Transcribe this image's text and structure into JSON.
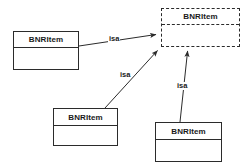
{
  "diagram": {
    "type": "uml-class-inheritance",
    "background_color": "#ffffff",
    "line_color": "#2b2b2b",
    "text_color": "#1a1a1a",
    "classes": [
      {
        "id": "superclass",
        "name": "BNRItem",
        "border_style": "dashed",
        "x": 161,
        "y": 8,
        "width": 79,
        "height": 39,
        "header_height": 16
      },
      {
        "id": "subclass-left",
        "name": "BNRItem",
        "border_style": "solid",
        "x": 13,
        "y": 31,
        "width": 66,
        "height": 39,
        "header_height": 16
      },
      {
        "id": "subclass-center",
        "name": "BNRItem",
        "border_style": "solid",
        "x": 53,
        "y": 108,
        "width": 65,
        "height": 38,
        "header_height": 17
      },
      {
        "id": "subclass-right",
        "name": "BNRItem",
        "border_style": "solid",
        "x": 155,
        "y": 122,
        "width": 67,
        "height": 40,
        "header_height": 17
      }
    ],
    "edges": [
      {
        "id": "isa-left",
        "label": "isa",
        "from": "subclass-left",
        "to": "superclass",
        "x1": 79,
        "y1": 46,
        "x2": 159,
        "y2": 34,
        "label_x": 108,
        "label_y": 35
      },
      {
        "id": "isa-center",
        "label": "isa",
        "from": "subclass-center",
        "to": "superclass",
        "x1": 105,
        "y1": 108,
        "x2": 160,
        "y2": 48,
        "label_x": 119,
        "label_y": 71
      },
      {
        "id": "isa-right",
        "label": "isa",
        "from": "subclass-right",
        "to": "superclass",
        "x1": 180,
        "y1": 122,
        "x2": 188,
        "y2": 48,
        "label_x": 176,
        "label_y": 82
      }
    ]
  }
}
